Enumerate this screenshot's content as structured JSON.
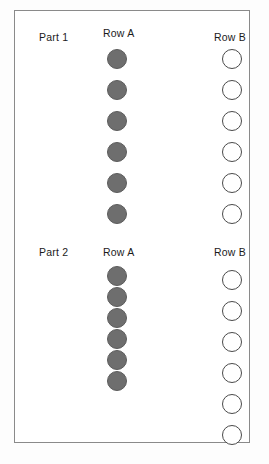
{
  "figure": {
    "frame": {
      "border_color": "#8a8a8a",
      "background": "#ffffff"
    },
    "colors": {
      "filled_circle": "#6e6e6e",
      "filled_circle_border": "#5c5c5c",
      "open_circle_border": "#4a4a4a",
      "open_circle_fill": "#ffffff",
      "text": "#1b1b1b"
    }
  },
  "parts": [
    {
      "label": "Part 1",
      "rows": [
        {
          "label": "Row A",
          "circle_style": "filled",
          "count": 6,
          "spacing_px": 31,
          "diameter_px": 20
        },
        {
          "label": "Row B",
          "circle_style": "open",
          "count": 6,
          "spacing_px": 31,
          "diameter_px": 20
        }
      ]
    },
    {
      "label": "Part 2",
      "rows": [
        {
          "label": "Row A",
          "circle_style": "filled",
          "count": 6,
          "spacing_px": 21,
          "diameter_px": 20
        },
        {
          "label": "Row B",
          "circle_style": "open",
          "count": 6,
          "spacing_px": 31,
          "diameter_px": 20
        }
      ]
    }
  ],
  "chart_data": {
    "type": "table",
    "xlabel": "",
    "ylabel": "",
    "categories": [
      "Part 1 Row A",
      "Part 1 Row B",
      "Part 2 Row A",
      "Part 2 Row B"
    ],
    "values": [
      6,
      6,
      6,
      6
    ],
    "series": [
      {
        "name": "Filled circles",
        "values": [
          6,
          0,
          6,
          0
        ]
      },
      {
        "name": "Open circles",
        "values": [
          0,
          6,
          0,
          6
        ]
      }
    ],
    "legend": [
      "Filled circles",
      "Open circles"
    ],
    "grid": false,
    "annotations": [
      "Part 1 Row A: 6 filled gray circles, evenly spaced",
      "Part 1 Row B: 6 open outlined circles, evenly spaced",
      "Part 2 Row A: 6 filled gray circles, touching/overlapping",
      "Part 2 Row B: 6 open outlined circles, evenly spaced"
    ]
  },
  "layout": {
    "part1": {
      "label_x": 24,
      "label_y": 20,
      "rowA_label_x": 88,
      "rowA_label_y": 16,
      "rowB_label_x": 199,
      "rowB_label_y": 20,
      "rowA_col_x": 92,
      "rowA_col_y": 38,
      "rowB_col_x": 207,
      "rowB_col_y": 38
    },
    "part2": {
      "label_x": 24,
      "label_y": 235,
      "rowA_label_x": 88,
      "rowA_label_y": 235,
      "rowB_label_x": 199,
      "rowB_label_y": 235,
      "rowA_col_x": 92,
      "rowA_col_y": 255,
      "rowB_col_x": 207,
      "rowB_col_y": 259
    }
  }
}
